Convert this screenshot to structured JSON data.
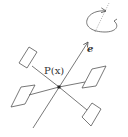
{
  "diagram": {
    "type": "quadrotor-schematic",
    "labels": {
      "point": "P(x)",
      "axis": "e"
    },
    "elements": {
      "center_point": "P",
      "axis_vector": "e",
      "rotors": 4,
      "rotation_indicator": "counter-clockwise arrow around dashed axis"
    },
    "colors": {
      "line": "#555555",
      "dashed_axis": "#888888",
      "center_dot": "#222222",
      "background": "#ffffff"
    }
  }
}
